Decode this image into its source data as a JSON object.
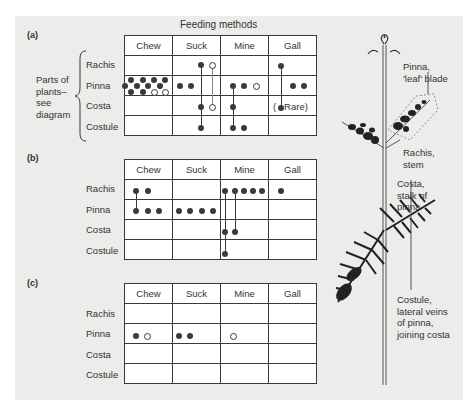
{
  "figure": {
    "title": "Feeding methods",
    "columns": [
      "Chew",
      "Suck",
      "Mine",
      "Gall"
    ],
    "rows": [
      "Rachis",
      "Pinna",
      "Costa",
      "Costule"
    ],
    "side_label": "Parts of plants– see diagram",
    "side_label_lines": [
      "Parts of",
      "plants–",
      "see",
      "diagram"
    ],
    "legend": {
      "filled_dot": "species (filled circle)",
      "open_dot": "species (open circle)",
      "connector": "vertical line = same species feeds on multiple parts"
    },
    "panels": [
      {
        "label": "(a)",
        "cells": {
          "Rachis": {
            "Chew": "",
            "Suck": "1 filled, 1 open (linked down)",
            "Mine": "",
            "Gall": "1 filled (linked down)"
          },
          "Pinna": {
            "Chew": "10 filled, 2 open",
            "Suck": "2 filled",
            "Mine": "2 filled, 1 open",
            "Gall": "2 filled"
          },
          "Costa": {
            "Chew": "",
            "Suck": "1 filled, 1 open",
            "Mine": "1 filled",
            "Gall": "1 filled (Rare)"
          },
          "Costule": {
            "Chew": "",
            "Suck": "1 filled",
            "Mine": "2 filled",
            "Gall": ""
          }
        },
        "annotation": "( Rare)"
      },
      {
        "label": "(b)",
        "cells": {
          "Rachis": {
            "Chew": "2 filled",
            "Suck": "",
            "Mine": "5 filled",
            "Gall": "1 filled"
          },
          "Pinna": {
            "Chew": "3 filled",
            "Suck": "4 filled",
            "Mine": "",
            "Gall": ""
          },
          "Costa": {
            "Chew": "",
            "Suck": "",
            "Mine": "2 filled",
            "Gall": ""
          },
          "Costule": {
            "Chew": "",
            "Suck": "",
            "Mine": "1 filled",
            "Gall": ""
          }
        }
      },
      {
        "label": "(c)",
        "cells": {
          "Rachis": {
            "Chew": "",
            "Suck": "",
            "Mine": "",
            "Gall": ""
          },
          "Pinna": {
            "Chew": "1 filled, 1 open",
            "Suck": "2 filled",
            "Mine": "1 open",
            "Gall": ""
          },
          "Costa": {
            "Chew": "",
            "Suck": "",
            "Mine": "",
            "Gall": ""
          },
          "Costule": {
            "Chew": "",
            "Suck": "",
            "Mine": "",
            "Gall": ""
          }
        }
      }
    ],
    "plant_labels": {
      "pinna": [
        "Pinna,",
        "'leaf' blade"
      ],
      "rachis": [
        "Rachis,",
        "stem"
      ],
      "costa": [
        "Costa,",
        "stalk of",
        "pinna"
      ],
      "costule": [
        "Costule,",
        "lateral veins",
        "of pinna,",
        "joining costa"
      ]
    },
    "colors": {
      "panel_bg": "#ececea",
      "ink": "#3a3a3a",
      "cell_bg": "#ffffff"
    }
  }
}
